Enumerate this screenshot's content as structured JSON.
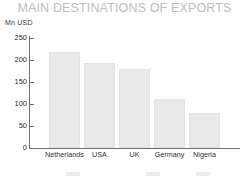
{
  "chart_data": {
    "type": "bar",
    "title": "MAIN DESTINATIONS OF EXPORTS",
    "xlabel": "",
    "ylabel": "Mn USD",
    "categories": [
      "Netherlands",
      "USA",
      "UK",
      "Germany",
      "Nigeria"
    ],
    "values": [
      218,
      192,
      178,
      111,
      80
    ],
    "ylim": [
      0,
      250
    ],
    "yticks": [
      0,
      50,
      100,
      150,
      200,
      250
    ],
    "ytick_labels": [
      "0",
      "50",
      "100",
      "150",
      "200",
      "250"
    ],
    "grid": false,
    "legend": "none",
    "series": [
      {
        "name": "Exports",
        "values": [
          218,
          192,
          178,
          111,
          80
        ],
        "color": "#e9e9e9"
      }
    ]
  },
  "colors": {
    "title": "#bdbdbd",
    "axis": "#6e6e6e",
    "bar_fill": "#e9e9e9",
    "tick_text": "#2f2f2f",
    "background": "#ffffff"
  }
}
